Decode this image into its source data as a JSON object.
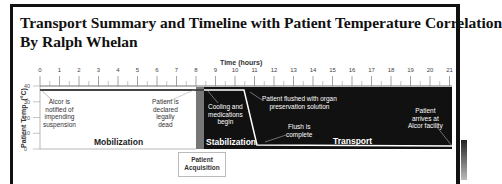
{
  "header": {
    "title": "Transport Summary and Timeline with Patient Temperature Correlation",
    "byline": "By Ralph Whelan"
  },
  "chart_data": {
    "type": "line",
    "title": "Transport Summary and Timeline with Patient Temperature Correlation",
    "subtitle": "By Ralph Whelan",
    "xlabel": "Time (hours)",
    "ylabel": "Patient Temp. (°C)",
    "xlim": [
      0,
      21
    ],
    "ylim": [
      0,
      40
    ],
    "x_ticks": [
      "0",
      "1",
      "2",
      "3",
      "4",
      "5",
      "6",
      "7",
      "8",
      "9",
      "10",
      "11",
      "12",
      "13",
      "14",
      "15",
      "16",
      "17",
      "18",
      "19",
      "20",
      "21"
    ],
    "y_ticks": [
      "0",
      "10",
      "20",
      "30",
      "40"
    ],
    "series": [
      {
        "name": "Patient Temperature",
        "x": [
          0,
          8.4,
          11.0,
          11.6,
          21
        ],
        "values": [
          37,
          37,
          36,
          2,
          1.5
        ]
      }
    ],
    "phases": [
      {
        "label": "Mobilization",
        "start": 0,
        "end": 8.4
      },
      {
        "label": "Patient Acquisition",
        "start": 8.4,
        "end": 8.8
      },
      {
        "label": "Stabilization",
        "start": 8.8,
        "end": 11.6
      },
      {
        "label": "Transport",
        "start": 11.6,
        "end": 21
      }
    ],
    "annotations": [
      {
        "text": "Alcor is notified of impending suspension",
        "x": 0
      },
      {
        "text": "Patient is declared legally dead",
        "x": 8.4
      },
      {
        "text": "Cooling and medications begin",
        "x": 8.8
      },
      {
        "text": "Patient flushed with organ preservation solution",
        "x": 11.2
      },
      {
        "text": "Flush is complete",
        "x": 11.6
      },
      {
        "text": "Patient arrives at Alcor facility",
        "x": 21
      }
    ],
    "grid": false,
    "legend": "none"
  },
  "labels": {
    "alcor_notified": [
      "Alcor is",
      "notified of",
      "impending",
      "suspension"
    ],
    "declared_dead": [
      "Patient is",
      "declared",
      "legally",
      "dead"
    ],
    "cooling": [
      "Cooling and",
      "medications",
      "begin"
    ],
    "flushed": [
      "Patient flushed with organ",
      "preservation solution"
    ],
    "flush_complete": [
      "Flush is",
      "complete"
    ],
    "arrives": [
      "Patient",
      "arrives at",
      "Alcor facility"
    ],
    "mobilization": "Mobilization",
    "stabilization": "Stabilization",
    "transport": "Transport",
    "acquisition": [
      "Patient",
      "Acquisition"
    ]
  },
  "colors": {
    "dark_region": "#111111",
    "acquisition_band": "#777777",
    "temp_line_light": "#ffffff",
    "temp_line_dark": "#333333"
  }
}
